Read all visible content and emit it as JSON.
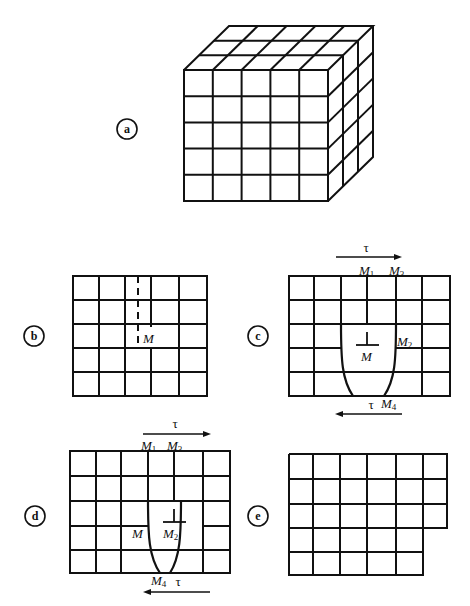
{
  "figure": {
    "colors": {
      "line": "#111111",
      "background": "#ffffff"
    },
    "panels": [
      {
        "id": "a",
        "label": "a",
        "caption_role": "3D cubic crystal lattice (5x5 front face, 3 layers deep)"
      },
      {
        "id": "b",
        "label": "b",
        "caption_role": "Edge dislocation with extra half-plane",
        "dislocation_label": "M"
      },
      {
        "id": "c",
        "label": "c",
        "caption_role": "Dislocation loop under shear stress",
        "labels": {
          "m1": "M",
          "m1_sub": "1",
          "m3": "M",
          "m3_sub": "3",
          "m2": "M",
          "m2_sub": "2",
          "m4": "M",
          "m4_sub": "4",
          "m": "M",
          "tau_top": "τ",
          "tau_bottom": "τ"
        }
      },
      {
        "id": "d",
        "label": "d",
        "caption_role": "Dislocation moved to M2",
        "labels": {
          "m1": "M",
          "m1_sub": "1",
          "m3": "M",
          "m3_sub": "3",
          "m2": "M",
          "m2_sub": "2",
          "m4": "M",
          "m4_sub": "4",
          "m": "M",
          "tau_top": "τ",
          "tau_bottom": "τ"
        }
      },
      {
        "id": "e",
        "label": "e",
        "caption_role": "Resulting slip step (6 columns top, 5 columns bottom)"
      }
    ]
  }
}
